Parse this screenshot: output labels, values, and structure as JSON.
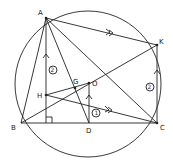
{
  "diagram": {
    "type": "geometry",
    "circle": {
      "cx": 88,
      "cy": 84,
      "r": 73
    },
    "points": {
      "A": {
        "label": "A",
        "x": 46,
        "y": 18
      },
      "B": {
        "label": "B",
        "x": 21,
        "y": 123
      },
      "C": {
        "label": "C",
        "x": 157,
        "y": 123
      },
      "K": {
        "label": "K",
        "x": 157,
        "y": 45
      },
      "D": {
        "label": "D",
        "x": 89,
        "y": 123
      },
      "O": {
        "label": "O",
        "x": 89,
        "y": 83
      },
      "H": {
        "label": "H",
        "x": 46,
        "y": 95
      },
      "G": {
        "label": "G",
        "x": 75,
        "y": 88
      }
    },
    "segment_labels": {
      "AH": "②",
      "KC": "②",
      "OD": "①"
    },
    "markers": {
      "parallel_AK": "≫",
      "parallel_HC": "≫"
    }
  }
}
